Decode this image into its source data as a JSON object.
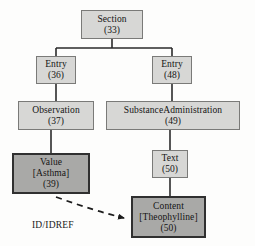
{
  "diagram": {
    "background_color": "#fdfdfc",
    "node_fill_light": "#d7d7d5",
    "node_fill_dark": "#a9a9a7",
    "edge_color": "#2b2b2b",
    "nodes": [
      {
        "id": "section",
        "name": "Section",
        "line1": "Section",
        "line2": "(33)",
        "line3": "",
        "style": "light",
        "x": 81,
        "y": 10,
        "w": 62,
        "h": 29
      },
      {
        "id": "entry-left",
        "name": "Entry",
        "line1": "Entry",
        "line2": "(36)",
        "line3": "",
        "style": "light",
        "x": 36,
        "y": 56,
        "w": 40,
        "h": 28
      },
      {
        "id": "entry-right",
        "name": "Entry",
        "line1": "Entry",
        "line2": "(48)",
        "line3": "",
        "style": "light",
        "x": 152,
        "y": 56,
        "w": 40,
        "h": 28
      },
      {
        "id": "observation",
        "name": "Observation",
        "line1": "Observation",
        "line2": "(37)",
        "line3": "",
        "style": "light",
        "x": 18,
        "y": 101,
        "w": 76,
        "h": 29
      },
      {
        "id": "substance-administration",
        "name": "SubstanceAdministration",
        "line1": "SubstanceAdministration",
        "line2": "(49)",
        "line3": "",
        "style": "light",
        "x": 106,
        "y": 101,
        "w": 134,
        "h": 29
      },
      {
        "id": "value",
        "name": "Value",
        "line1": "Value",
        "line2": "[Asthma]",
        "line3": "(39)",
        "style": "dark",
        "x": 12,
        "y": 153,
        "w": 78,
        "h": 41
      },
      {
        "id": "text",
        "name": "Text",
        "line1": "Text",
        "line2": "(50)",
        "line3": "",
        "style": "light",
        "x": 152,
        "y": 150,
        "w": 36,
        "h": 28
      },
      {
        "id": "content",
        "name": "Content",
        "line1": "Content",
        "line2": "[Theophylline]",
        "line3": "(50)",
        "style": "dark",
        "x": 131,
        "y": 196,
        "w": 75,
        "h": 42
      }
    ],
    "edges": [
      {
        "id": "section-to-entry-left",
        "from": "section",
        "to": "entry-left",
        "kind": "orthogonal"
      },
      {
        "id": "section-to-entry-right",
        "from": "section",
        "to": "entry-right",
        "kind": "orthogonal"
      },
      {
        "id": "entry-left-to-observation",
        "from": "entry-left",
        "to": "observation",
        "kind": "straight"
      },
      {
        "id": "entry-right-to-substance",
        "from": "entry-right",
        "to": "substance-administration",
        "kind": "straight"
      },
      {
        "id": "observation-to-value",
        "from": "observation",
        "to": "value",
        "kind": "straight"
      },
      {
        "id": "substance-to-text",
        "from": "substance-administration",
        "to": "text",
        "kind": "straight"
      },
      {
        "id": "text-to-content",
        "from": "text",
        "to": "content",
        "kind": "straight"
      },
      {
        "id": "value-to-content-idref",
        "from": "value",
        "to": "content",
        "kind": "dashed-arrow",
        "label": "ID/IDREF"
      }
    ],
    "labels": {
      "id_idref": "ID/IDREF"
    }
  }
}
